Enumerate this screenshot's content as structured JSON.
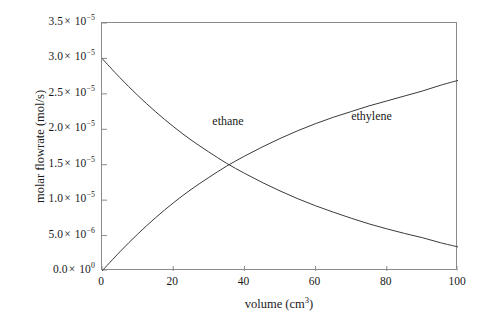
{
  "chart_data": {
    "type": "line",
    "title": "",
    "xlabel": "volume (cm3)",
    "ylabel": "molar flowrate (mol/s)",
    "xlim": [
      0,
      100
    ],
    "ylim": [
      0,
      3.5e-05
    ],
    "grid": false,
    "legend_position": "inline-annotation",
    "xticks": [
      0,
      20,
      40,
      60,
      80,
      100
    ],
    "xtick_labels": [
      "0",
      "20",
      "40",
      "60",
      "80",
      "100"
    ],
    "yticks": [
      0,
      5e-06,
      1e-05,
      1.5e-05,
      2e-05,
      2.5e-05,
      3e-05,
      3.5e-05
    ],
    "ytick_labels": [
      "0.0 × 10^0",
      "5.0 × 10^-6",
      "1.0 × 10^-5",
      "1.5 × 10^-5",
      "2.0 × 10^-5",
      "2.5 × 10^-5",
      "3.0 × 10^-5",
      "3.5 × 10^-5"
    ],
    "x": [
      0,
      5,
      10,
      15,
      20,
      25,
      30,
      35,
      40,
      45,
      50,
      55,
      60,
      65,
      70,
      75,
      80,
      85,
      90,
      95,
      100
    ],
    "series": [
      {
        "name": "ethane",
        "color": "#3a3a3a",
        "values": [
          3e-05,
          2.73e-05,
          2.48e-05,
          2.25e-05,
          2.04e-05,
          1.85e-05,
          1.68e-05,
          1.52e-05,
          1.38e-05,
          1.25e-05,
          1.13e-05,
          1.02e-05,
          9.2e-06,
          8.3e-06,
          7.45e-06,
          6.65e-06,
          5.95e-06,
          5.3e-06,
          4.7e-06,
          4e-06,
          3.4e-06
        ]
      },
      {
        "name": "ethylene",
        "color": "#3a3a3a",
        "values": [
          0.0,
          2.7e-06,
          5.2e-06,
          7.5e-06,
          9.6e-06,
          1.15e-05,
          1.32e-05,
          1.48e-05,
          1.62e-05,
          1.75e-05,
          1.87e-05,
          1.98e-05,
          2.08e-05,
          2.17e-05,
          2.25e-05,
          2.33e-05,
          2.4e-05,
          2.47e-05,
          2.54e-05,
          2.62e-05,
          2.69e-05
        ]
      }
    ],
    "annotations": [
      {
        "text": "ethane",
        "x": 31,
        "y": 2.1e-05
      },
      {
        "text": "ethylene",
        "x": 70,
        "y": 2.18e-05
      }
    ]
  },
  "axis": {
    "x_title_main": "volume (cm",
    "x_title_sup": "3",
    "x_title_close": ")",
    "y_title": "molar flowrate (mol/s)"
  },
  "ytick_parts": [
    {
      "mantissa": "3.5",
      "exp": "−5"
    },
    {
      "mantissa": "3.0",
      "exp": "−5"
    },
    {
      "mantissa": "2.5",
      "exp": "−5"
    },
    {
      "mantissa": "2.0",
      "exp": "−5"
    },
    {
      "mantissa": "1.5",
      "exp": "−5"
    },
    {
      "mantissa": "1.0",
      "exp": "−5"
    },
    {
      "mantissa": "5.0",
      "exp": "−6"
    },
    {
      "mantissa": "0.0",
      "exp": "0"
    }
  ],
  "annotations": {
    "ethane_label": "ethane",
    "ethylene_label": "ethylene"
  }
}
